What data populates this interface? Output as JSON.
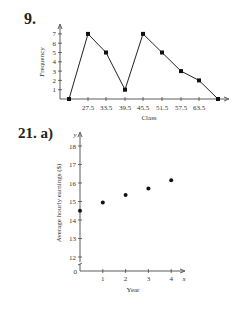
{
  "problems": [
    {
      "label": "9."
    },
    {
      "label": "21. a)"
    }
  ],
  "chart_data": [
    {
      "type": "line",
      "title": "",
      "xlabel": "Class",
      "ylabel": "Frequency",
      "categories": [
        "",
        "27.5",
        "33.5",
        "39.5",
        "45.5",
        "51.5",
        "57.5",
        "63.5",
        ""
      ],
      "values": [
        0,
        7,
        5,
        1,
        7,
        5,
        3,
        2,
        0
      ],
      "y_ticks": [
        "1",
        "2",
        "3",
        "4",
        "5",
        "6",
        "7"
      ],
      "ylim": [
        0,
        7.5
      ],
      "grid": false,
      "markers": true
    },
    {
      "type": "scatter",
      "title": "",
      "xlabel": "Year",
      "ylabel": "Average hourly earnings ($)",
      "x_axis_symbol": "x",
      "y_axis_symbol": "y",
      "x": [
        0,
        1,
        2,
        3,
        4
      ],
      "y": [
        14.5,
        14.95,
        15.35,
        15.7,
        16.15
      ],
      "x_ticks": [
        "1",
        "2",
        "3",
        "4"
      ],
      "y_ticks": [
        "12",
        "13",
        "14",
        "15",
        "16",
        "17",
        "18"
      ],
      "origin_label": "0",
      "ylim": [
        12,
        18
      ],
      "axis_break": true,
      "grid": false
    }
  ]
}
